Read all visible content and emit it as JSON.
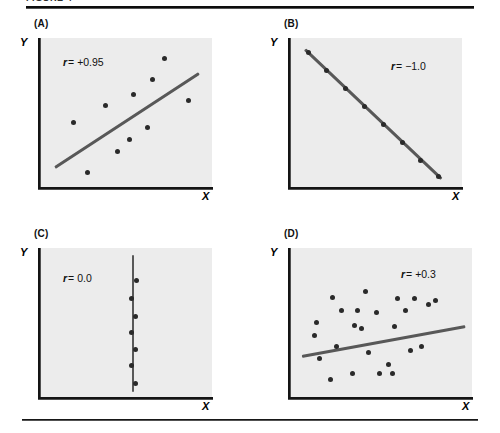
{
  "page": {
    "running_head": "FIGURE 4",
    "top_rule": "horizontal-rule",
    "bottom_rule": "horizontal-rule"
  },
  "axis_labels": {
    "x": "X",
    "y": "Y"
  },
  "panels": [
    {
      "key": "A",
      "label": "(A)",
      "r_symbol": "r",
      "r_text": "= +0.95",
      "r_value": "+0.95"
    },
    {
      "key": "B",
      "label": "(B)",
      "r_symbol": "r",
      "r_text": "= −1.0",
      "r_value": "-1.0"
    },
    {
      "key": "C",
      "label": "(C)",
      "r_symbol": "r",
      "r_text": "= 0.0",
      "r_value": "0.0"
    },
    {
      "key": "D",
      "label": "(D)",
      "r_symbol": "r",
      "r_text": "= +0.3",
      "r_value": "+0.3"
    }
  ],
  "colors": {
    "plot_background": "#ececec",
    "point": "#2a2a2a",
    "line": "#585858",
    "axis": "#141414",
    "page_background": "#ffffff"
  },
  "chart_data": [
    {
      "type": "scatter",
      "panel": "A",
      "title": "(A)",
      "xlabel": "X",
      "ylabel": "Y",
      "annotation": "r = +0.95",
      "correlation": 0.95,
      "xlim": [
        0,
        100
      ],
      "ylim": [
        0,
        100
      ],
      "grid": false,
      "legend": "none",
      "points": [
        {
          "x": 19,
          "y": 43
        },
        {
          "x": 27,
          "y": 10
        },
        {
          "x": 38,
          "y": 55
        },
        {
          "x": 45,
          "y": 24
        },
        {
          "x": 52,
          "y": 32
        },
        {
          "x": 54,
          "y": 62
        },
        {
          "x": 62,
          "y": 40
        },
        {
          "x": 65,
          "y": 72
        },
        {
          "x": 72,
          "y": 86
        },
        {
          "x": 86,
          "y": 58
        }
      ],
      "fit_line": {
        "x0": 8,
        "y0": 13,
        "x1": 92,
        "y1": 76
      }
    },
    {
      "type": "scatter",
      "panel": "B",
      "title": "(B)",
      "xlabel": "X",
      "ylabel": "Y",
      "annotation": "r = -1.0",
      "correlation": -1.0,
      "xlim": [
        0,
        100
      ],
      "ylim": [
        0,
        100
      ],
      "grid": false,
      "legend": "none",
      "points": [
        {
          "x": 10,
          "y": 90
        },
        {
          "x": 21,
          "y": 78
        },
        {
          "x": 32,
          "y": 66
        },
        {
          "x": 43,
          "y": 54
        },
        {
          "x": 54,
          "y": 42
        },
        {
          "x": 65,
          "y": 30
        },
        {
          "x": 76,
          "y": 18
        },
        {
          "x": 86,
          "y": 7
        }
      ],
      "fit_line": {
        "x0": 8,
        "y0": 92,
        "x1": 88,
        "y1": 5
      }
    },
    {
      "type": "scatter",
      "panel": "C",
      "title": "(C)",
      "xlabel": "X",
      "ylabel": "Y",
      "annotation": "r = 0.0",
      "correlation": 0.0,
      "xlim": [
        0,
        100
      ],
      "ylim": [
        0,
        100
      ],
      "grid": false,
      "legend": "none",
      "points": [
        {
          "x": 56,
          "y": 78
        },
        {
          "x": 53,
          "y": 66
        },
        {
          "x": 55,
          "y": 54
        },
        {
          "x": 53,
          "y": 43
        },
        {
          "x": 55,
          "y": 32
        },
        {
          "x": 53,
          "y": 21
        },
        {
          "x": 55,
          "y": 9
        }
      ],
      "fit_line": {
        "x0": 54,
        "y0": 95,
        "x1": 54,
        "y1": 3
      }
    },
    {
      "type": "scatter",
      "panel": "D",
      "title": "(D)",
      "xlabel": "X",
      "ylabel": "Y",
      "annotation": "r = +0.3",
      "correlation": 0.3,
      "xlim": [
        0,
        100
      ],
      "ylim": [
        0,
        100
      ],
      "grid": false,
      "legend": "none",
      "points": [
        {
          "x": 13,
          "y": 41
        },
        {
          "x": 14,
          "y": 50
        },
        {
          "x": 16,
          "y": 26
        },
        {
          "x": 22,
          "y": 12
        },
        {
          "x": 23,
          "y": 67
        },
        {
          "x": 25,
          "y": 34
        },
        {
          "x": 28,
          "y": 58
        },
        {
          "x": 34,
          "y": 16
        },
        {
          "x": 35,
          "y": 48
        },
        {
          "x": 37,
          "y": 58
        },
        {
          "x": 39,
          "y": 46
        },
        {
          "x": 41,
          "y": 71
        },
        {
          "x": 43,
          "y": 30
        },
        {
          "x": 47,
          "y": 57
        },
        {
          "x": 49,
          "y": 16
        },
        {
          "x": 54,
          "y": 22
        },
        {
          "x": 56,
          "y": 16
        },
        {
          "x": 57,
          "y": 47
        },
        {
          "x": 59,
          "y": 66
        },
        {
          "x": 63,
          "y": 58
        },
        {
          "x": 66,
          "y": 31
        },
        {
          "x": 68,
          "y": 66
        },
        {
          "x": 72,
          "y": 34
        },
        {
          "x": 76,
          "y": 62
        },
        {
          "x": 80,
          "y": 65
        }
      ],
      "fit_line": {
        "x0": 6,
        "y0": 27,
        "x1": 96,
        "y1": 47
      }
    }
  ]
}
